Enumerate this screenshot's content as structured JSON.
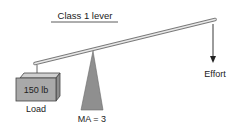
{
  "diagram": {
    "title": "Class 1 lever",
    "load": {
      "weight_label": "150 lb",
      "label": "Load"
    },
    "fulcrum": {
      "label": "MA = 3"
    },
    "effort": {
      "label": "Effort",
      "direction": "down"
    },
    "colors": {
      "lever": "#e8e8e8",
      "lever_outline": "#7a7a7a",
      "fulcrum": "#8f8f8f",
      "box_front": "#a9a9a9",
      "box_top": "#cfcfcf",
      "box_side": "#8c8c8c",
      "ink": "#222222"
    }
  }
}
